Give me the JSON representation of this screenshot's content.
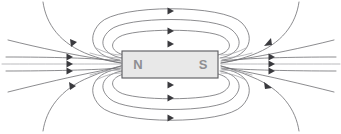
{
  "figure": {
    "type": "physics-diagram",
    "width": 341,
    "height": 134,
    "background_color": "#ffffff"
  },
  "magnet": {
    "name": "bar-magnet",
    "x": 122,
    "y": 51,
    "width": 96,
    "height": 27,
    "fill_color": "#e8e8e8",
    "border_color": "#58585c",
    "north_label": "N",
    "south_label": "S",
    "label_color": "#8e8e92",
    "north_label_x": 138,
    "south_label_x": 203,
    "label_y": 65
  },
  "field": {
    "line_color": "#6e6e72",
    "faint_line_color": "#a8a8ac",
    "arrow_color": "#3a3a3e",
    "line_width": 0.8,
    "arrow_count": 20,
    "description": "Field lines emerge from the S pole on the right and re-enter at the N pole on the left, forming nested closed loops above and below the bar magnet.",
    "loops_above": 3,
    "loops_below": 3,
    "axial_lines": 3,
    "outer_sweeping_lines": 4
  },
  "arrows": {
    "top_center": [
      {
        "x": 171,
        "y": 11
      },
      {
        "x": 171,
        "y": 31
      },
      {
        "x": 171,
        "y": 44
      }
    ],
    "bottom_center": [
      {
        "x": 171,
        "y": 85
      },
      {
        "x": 171,
        "y": 98
      },
      {
        "x": 171,
        "y": 118
      }
    ],
    "left_axial": [
      {
        "x": 70,
        "y": 57
      },
      {
        "x": 70,
        "y": 64
      },
      {
        "x": 70,
        "y": 71
      }
    ],
    "right_axial": [
      {
        "x": 272,
        "y": 57
      },
      {
        "x": 272,
        "y": 64
      },
      {
        "x": 272,
        "y": 71
      }
    ],
    "left_upper": {
      "x": 74,
      "y": 43
    },
    "left_lower": {
      "x": 72,
      "y": 86
    },
    "right_upper": {
      "x": 268,
      "y": 43
    },
    "right_lower": {
      "x": 270,
      "y": 86
    }
  }
}
